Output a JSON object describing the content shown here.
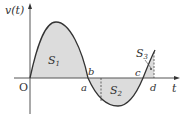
{
  "diagram": {
    "type": "velocity-time graph",
    "y_axis_label": "v(t)",
    "x_axis_label": "t",
    "origin_label": "O",
    "point_labels": {
      "a": "a",
      "b": "b",
      "c": "c",
      "d": "d"
    },
    "regions": [
      {
        "label": "S",
        "sub": "1",
        "sign": "positive"
      },
      {
        "label": "S",
        "sub": "2",
        "sign": "negative"
      },
      {
        "label": "S",
        "sub": "3",
        "sign": "positive"
      }
    ],
    "colors": {
      "fill": "#dcdcdc",
      "curve": "#333333",
      "axis": "#555555"
    }
  }
}
